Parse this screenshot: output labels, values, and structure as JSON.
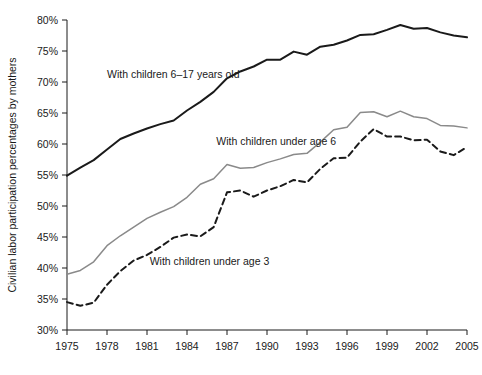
{
  "chart_data": {
    "type": "line",
    "title": "",
    "xlabel": "",
    "ylabel": "Civilian labor participation percentages by mothers",
    "xlim": [
      1975,
      2005
    ],
    "ylim": [
      30,
      80
    ],
    "grid": false,
    "legend_position": "inline-annotations",
    "x_ticks": [
      "1975",
      "1978",
      "1981",
      "1984",
      "1987",
      "1990",
      "1993",
      "1996",
      "1999",
      "2002",
      "2005"
    ],
    "y_ticks": [
      "30%",
      "35%",
      "40%",
      "45%",
      "50%",
      "55%",
      "60%",
      "65%",
      "70%",
      "75%",
      "80%"
    ],
    "x": [
      1975,
      1976,
      1977,
      1978,
      1979,
      1980,
      1981,
      1982,
      1983,
      1984,
      1985,
      1986,
      1987,
      1988,
      1989,
      1990,
      1991,
      1992,
      1993,
      1994,
      1995,
      1996,
      1997,
      1998,
      1999,
      2000,
      2001,
      2002,
      2003,
      2004,
      2005
    ],
    "series": [
      {
        "name": "With children 6–17 years old",
        "style": "solid",
        "color": "#1a1a1a",
        "width": 2.0,
        "label_x": 1978.0,
        "label_y": 70.6,
        "values": [
          54.9,
          56.2,
          57.4,
          59.1,
          60.8,
          61.7,
          62.5,
          63.2,
          63.8,
          65.4,
          66.8,
          68.4,
          70.6,
          71.7,
          72.5,
          73.6,
          73.6,
          74.9,
          74.4,
          75.7,
          76.0,
          76.7,
          77.6,
          77.7,
          78.4,
          79.2,
          78.6,
          78.7,
          78.0,
          77.5,
          77.2
        ]
      },
      {
        "name": "With children under age 6",
        "style": "solid",
        "color": "#8a8a8a",
        "width": 1.5,
        "label_x": 1986.2,
        "label_y": 59.8,
        "values": [
          39.0,
          39.6,
          41.0,
          43.6,
          45.2,
          46.6,
          48.0,
          49.0,
          49.9,
          51.4,
          53.5,
          54.4,
          56.7,
          56.1,
          56.2,
          57.0,
          57.6,
          58.3,
          58.5,
          60.3,
          62.3,
          62.7,
          65.1,
          65.2,
          64.4,
          65.3,
          64.4,
          64.1,
          63.0,
          62.9,
          62.6
        ]
      },
      {
        "name": "With children under age 3",
        "style": "dashed",
        "color": "#1a1a1a",
        "width": 2.0,
        "label_x": 1981.2,
        "label_y": 40.5,
        "values": [
          34.5,
          33.9,
          34.4,
          37.3,
          39.5,
          41.2,
          42.1,
          43.4,
          44.9,
          45.4,
          45.1,
          46.6,
          52.2,
          52.5,
          51.5,
          52.5,
          53.2,
          54.2,
          53.8,
          56.0,
          57.7,
          57.8,
          60.4,
          62.4,
          61.2,
          61.2,
          60.6,
          60.7,
          58.8,
          58.2,
          59.5
        ]
      }
    ]
  },
  "footnote": ""
}
